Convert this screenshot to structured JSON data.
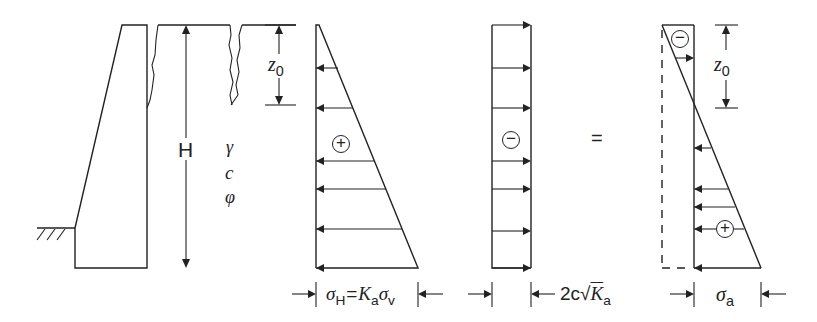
{
  "figure": {
    "wall": {
      "height_label": "H",
      "soil_params": [
        "γ",
        "c",
        "φ"
      ],
      "crack_depth_label": "z",
      "crack_depth_sub": "0"
    },
    "diagram_1": {
      "sign": "+",
      "label_sigma": "σ",
      "label_sigma_sub": "H",
      "label_eq": "=",
      "label_K": "K",
      "label_K_sub": "a",
      "label_sigma2": "σ",
      "label_sigma2_sub": "v"
    },
    "diagram_2": {
      "sign": "−",
      "label_prefix": "2c",
      "label_root": "√",
      "label_K": "K",
      "label_K_sub": "a"
    },
    "equals": "=",
    "diagram_3": {
      "sign_top": "−",
      "sign_bottom": "+",
      "depth_label": "z",
      "depth_sub": "0",
      "label_sigma": "σ",
      "label_sigma_sub": "a"
    },
    "colors": {
      "line": "#222222",
      "background": "#ffffff"
    }
  }
}
